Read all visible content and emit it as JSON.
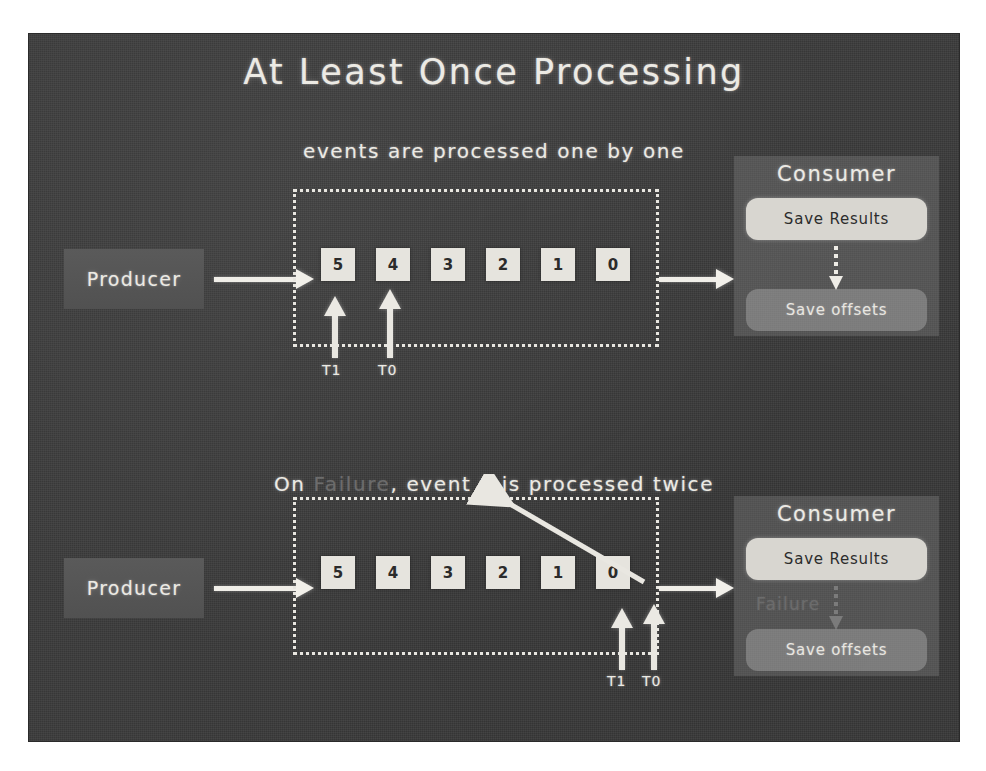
{
  "slide": {
    "title": "At Least Once Processing",
    "background_color": "#3b3b3b",
    "chalk_color": "#eceae4",
    "dim_chalk_color": "#6c6c6c"
  },
  "top_section": {
    "caption": "events are processed one by one",
    "producer_label": "Producer",
    "queue_cells": [
      "5",
      "4",
      "3",
      "2",
      "1",
      "0"
    ],
    "pointers": [
      {
        "label": "T1",
        "points_at": "1"
      },
      {
        "label": "T0",
        "points_at": "0"
      }
    ],
    "consumer": {
      "title": "Consumer",
      "steps": [
        {
          "label": "Save Results",
          "style": "bright"
        },
        {
          "label": "Save offsets",
          "style": "faint"
        }
      ]
    }
  },
  "bottom_section": {
    "caption_prefix": "On ",
    "caption_dim_word": "Failure",
    "caption_suffix": ", event 0 is processed twice",
    "producer_label": "Producer",
    "queue_cells": [
      "5",
      "4",
      "3",
      "2",
      "1",
      "0"
    ],
    "pointers": [
      {
        "label": "T1",
        "points_at": "0"
      },
      {
        "label": "T0",
        "points_at": "0"
      }
    ],
    "consumer": {
      "title": "Consumer",
      "steps": [
        {
          "label": "Save Results",
          "style": "bright"
        },
        {
          "label": "Save offsets",
          "style": "faint"
        }
      ],
      "failure_marker": "Failure"
    }
  }
}
